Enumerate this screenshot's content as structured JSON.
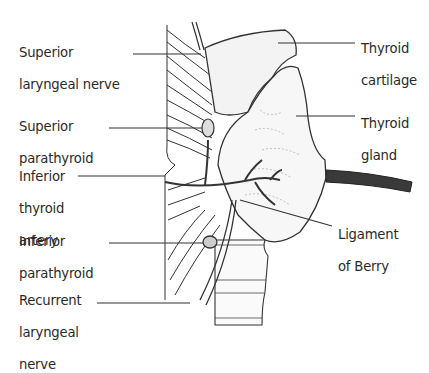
{
  "diagram": {
    "labels_left": [
      {
        "id": "superior-laryngeal-nerve",
        "lines": [
          "Superior",
          "laryngeal nerve"
        ]
      },
      {
        "id": "superior-parathyroid",
        "lines": [
          "Superior",
          "parathyroid"
        ]
      },
      {
        "id": "inferior-thyroid-artery",
        "lines": [
          "Inferior",
          "thyroid",
          "artery"
        ]
      },
      {
        "id": "inferior-parathyroid",
        "lines": [
          "Inferior",
          "parathyroid"
        ]
      },
      {
        "id": "recurrent-laryngeal-nerve",
        "lines": [
          "Recurrent",
          "laryngeal",
          "nerve"
        ]
      }
    ],
    "labels_right": [
      {
        "id": "thyroid-cartilage",
        "lines": [
          "Thyroid",
          "cartilage"
        ]
      },
      {
        "id": "thyroid-gland",
        "lines": [
          "Thyroid",
          "gland"
        ]
      },
      {
        "id": "ligament-of-berry",
        "lines": [
          "Ligament",
          "of Berry"
        ]
      }
    ]
  }
}
